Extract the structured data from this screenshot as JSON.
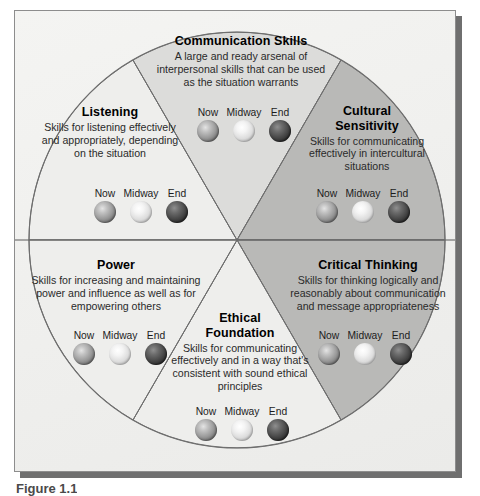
{
  "figure": {
    "caption": "Figure 1.1",
    "center_label": "",
    "scale_labels": [
      "Now",
      "Midway",
      "End"
    ]
  },
  "colors": {
    "panel_background": "#f2f2f0",
    "panel_border": "#8d8d8d",
    "panel_shadow": "#6f6f6f",
    "segment_light": "#eeeeec",
    "segment_medium": "#dcdcda",
    "segment_dark": "#b9b9b7",
    "segment_outline": "#6e6e6e",
    "text_primary": "#000000",
    "text_secondary": "#2a2a2a",
    "orb_now": "#9a9a9a",
    "orb_midway": "#e8e8e8",
    "orb_end": "#3a3a3a"
  },
  "segments": [
    {
      "id": "listening",
      "title": "Listening",
      "description": "Skills for listening effectively and appropriately, depending on the situation",
      "shade": "light",
      "scale": [
        {
          "label": "Now",
          "level": "now"
        },
        {
          "label": "Midway",
          "level": "midway"
        },
        {
          "label": "End",
          "level": "end"
        }
      ]
    },
    {
      "id": "communication-skills",
      "title": "Communication Skills",
      "description": "A large and ready arsenal of interpersonal skills that can be used as the situation warrants",
      "shade": "medium",
      "scale": [
        {
          "label": "Now",
          "level": "now"
        },
        {
          "label": "Midway",
          "level": "midway"
        },
        {
          "label": "End",
          "level": "end"
        }
      ]
    },
    {
      "id": "cultural-sensitivity",
      "title": "Cultural Sensitivity",
      "description": "Skills for communicating effectively in intercultural situations",
      "shade": "dark",
      "scale": [
        {
          "label": "Now",
          "level": "now"
        },
        {
          "label": "Midway",
          "level": "midway"
        },
        {
          "label": "End",
          "level": "end"
        }
      ]
    },
    {
      "id": "critical-thinking",
      "title": "Critical Thinking",
      "description": "Skills for thinking logically and reasonably about communication and message appropriateness",
      "shade": "dark",
      "scale": [
        {
          "label": "Now",
          "level": "now"
        },
        {
          "label": "Midway",
          "level": "midway"
        },
        {
          "label": "End",
          "level": "end"
        }
      ]
    },
    {
      "id": "ethical-foundation",
      "title": "Ethical Foundation",
      "description": "Skills for communicating effectively and in a way that's consistent with sound ethical principles",
      "shade": "light",
      "scale": [
        {
          "label": "Now",
          "level": "now"
        },
        {
          "label": "Midway",
          "level": "midway"
        },
        {
          "label": "End",
          "level": "end"
        }
      ]
    },
    {
      "id": "power",
      "title": "Power",
      "description": "Skills for increasing and maintaining power and influence as well as for empowering others",
      "shade": "light",
      "scale": [
        {
          "label": "Now",
          "level": "now"
        },
        {
          "label": "Midway",
          "level": "midway"
        },
        {
          "label": "End",
          "level": "end"
        }
      ]
    }
  ],
  "segment_titles_wrapped": {
    "cultural_sensitivity_line1": "Cultural",
    "cultural_sensitivity_line2": "Sensitivity",
    "ethical_foundation_line1": "Ethical",
    "ethical_foundation_line2": "Foundation"
  }
}
